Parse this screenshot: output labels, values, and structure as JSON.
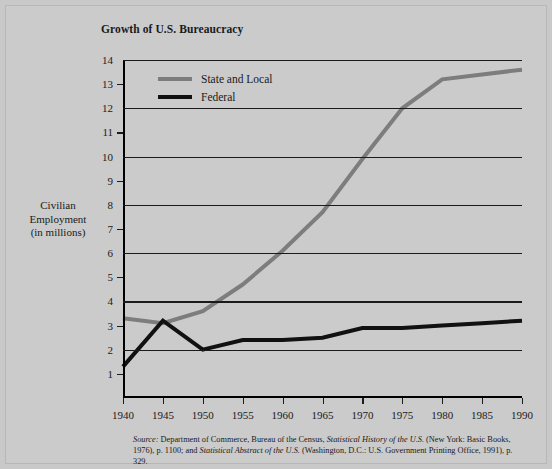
{
  "chart_data": {
    "type": "line",
    "title": "Growth of U.S. Bureaucracy",
    "xlabel": "",
    "ylabel": "Civilian Employment (in millions)",
    "ylabel_lines": [
      "Civilian",
      "Employment",
      "(in millions)"
    ],
    "x": [
      1940,
      1945,
      1950,
      1955,
      1960,
      1965,
      1970,
      1975,
      1980,
      1985,
      1990
    ],
    "categories": [
      "1940",
      "1945",
      "1950",
      "1955",
      "1960",
      "1965",
      "1970",
      "1975",
      "1980",
      "1985",
      "1990"
    ],
    "xlim": [
      1940,
      1990
    ],
    "ylim": [
      0,
      14
    ],
    "yticks": [
      1,
      2,
      3,
      4,
      5,
      6,
      7,
      8,
      9,
      10,
      11,
      12,
      13,
      14
    ],
    "ytick_labels": [
      "1",
      "2",
      "3",
      "4",
      "5",
      "6",
      "7",
      "8",
      "9",
      "10",
      "11",
      "12",
      "13",
      "14"
    ],
    "gridlines_at": [
      2,
      4,
      6,
      8,
      10,
      12,
      14
    ],
    "grid": true,
    "legend_position": "top-left inside plot",
    "series": [
      {
        "name": "State and Local",
        "color": "#7d7d7d",
        "values": [
          3.3,
          3.1,
          3.6,
          4.7,
          6.1,
          7.7,
          9.9,
          12.0,
          13.2,
          13.4,
          13.6
        ]
      },
      {
        "name": "Federal",
        "color": "#111111",
        "values": [
          1.3,
          3.2,
          2.0,
          2.4,
          2.4,
          2.5,
          2.9,
          2.9,
          3.0,
          3.1,
          3.2
        ]
      }
    ]
  },
  "legend": {
    "items": [
      {
        "label": "State and Local",
        "color": "#7d7d7d"
      },
      {
        "label": "Federal",
        "color": "#111111"
      }
    ]
  },
  "source": {
    "label": "Source:",
    "text_1": " Department of Commerce, Bureau of the Census, ",
    "italic_1": "Statistical History of the U.S.",
    "text_2": " (New York: Basic Books, 1976), p. 1100; and ",
    "italic_2": "Statistical Abstract of the U.S.",
    "text_3": " (Washington, D.C.: U.S. Government Printing Office, 1991), p. 329."
  }
}
